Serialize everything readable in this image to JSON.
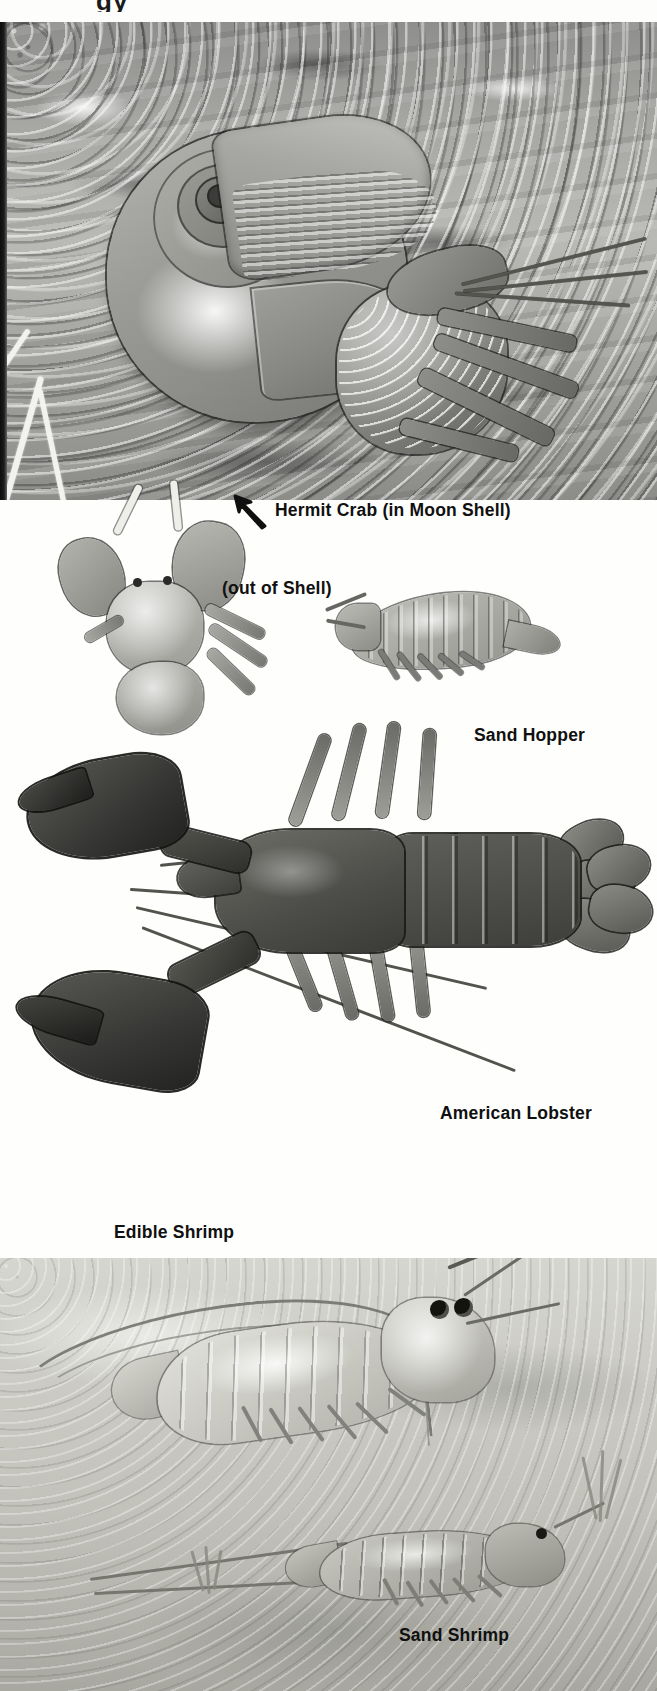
{
  "plate": {
    "title": "Crustaceans illustration plate",
    "page_header_fragment": "gy",
    "background_color": "#fdfdfb",
    "ink_color": "#101010"
  },
  "panels": [
    {
      "name": "hermit-crab-panel",
      "scene": "gravel seabed",
      "subjects": [
        "hermit crab",
        "moon shell"
      ]
    },
    {
      "name": "specimen-panel",
      "scene": "white background",
      "subjects": [
        "hermit crab out of shell",
        "sand hopper",
        "american lobster"
      ]
    },
    {
      "name": "shrimp-panel",
      "scene": "sandy seabed",
      "subjects": [
        "edible shrimp",
        "sand shrimp"
      ]
    }
  ],
  "labels": {
    "hermit_crab": "Hermit Crab (in Moon Shell)",
    "out_of_shell": "(out of Shell)",
    "sand_hopper": "Sand Hopper",
    "american_lobster": "American Lobster",
    "edible_shrimp": "Edible Shrimp",
    "sand_shrimp": "Sand Shrimp"
  },
  "annotations": {
    "arrow_icon": "arrow-up-left-icon",
    "arrow_target": "Hermit Crab (in Moon Shell)"
  }
}
